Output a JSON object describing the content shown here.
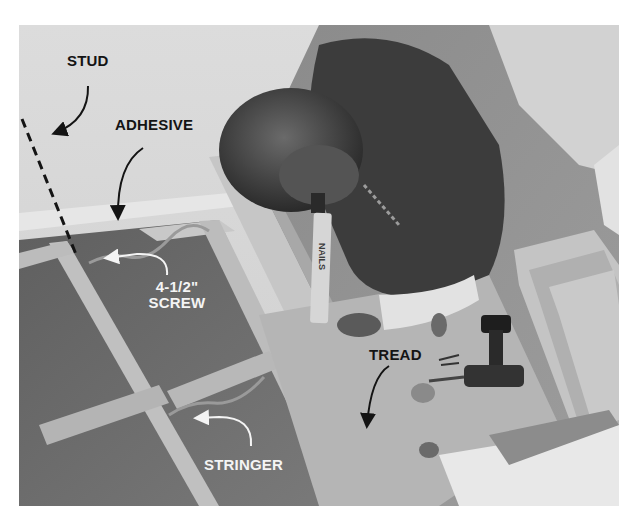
{
  "photo": {
    "description": "Black-and-white photo: man applying construction adhesive with caulk gun to stair stringer frame; drill and tread boards on floor",
    "caulk_tube_text": "NAILS"
  },
  "callouts": {
    "stud": "STUD",
    "adhesive": "ADHESIVE",
    "screw_line1": "4-1/2\"",
    "screw_line2": "SCREW",
    "tread": "TREAD",
    "stringer": "STRINGER"
  },
  "colors": {
    "wall": "#d8d8d8",
    "wood_light": "#bdbdbd",
    "wood_dark": "#6e6e6e",
    "shirt": "#3c3c3c",
    "label_dark": "#141414",
    "label_light": "#f4f4f4"
  }
}
